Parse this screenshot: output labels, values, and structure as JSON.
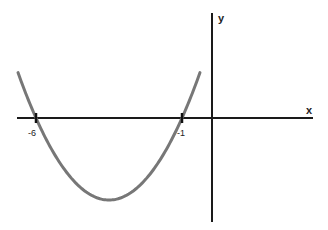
{
  "chart_data": {
    "type": "line",
    "title": "",
    "xlabel": "x",
    "ylabel": "y",
    "function": "y = a(x + 6)(x + 1), a > 0",
    "roots": [
      -6,
      -1
    ],
    "vertex": {
      "x": -3.5
    },
    "tick_labels": [
      "-6",
      "-1"
    ],
    "x_ticks": [
      -6,
      -1
    ],
    "grid": false,
    "legend": null,
    "curve_color": "#777777",
    "axis_color": "#1a1a1a"
  },
  "axes": {
    "x_label": "x",
    "y_label": "y"
  },
  "ticks": [
    {
      "value": -6,
      "label": "-6"
    },
    {
      "value": -1,
      "label": "-1"
    }
  ]
}
